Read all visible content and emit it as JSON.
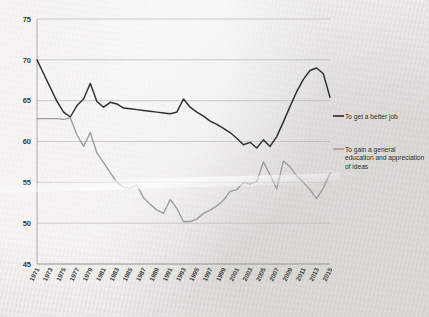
{
  "chart_data": {
    "type": "line",
    "title": "",
    "subtitle": "",
    "xlabel": "",
    "ylabel": "",
    "ylim": [
      45,
      75
    ],
    "yticks": [
      45,
      50,
      55,
      60,
      65,
      70,
      75
    ],
    "grid": true,
    "legend_position": "right",
    "x": [
      1971,
      1972,
      1973,
      1974,
      1975,
      1976,
      1977,
      1978,
      1979,
      1980,
      1981,
      1982,
      1983,
      1984,
      1985,
      1986,
      1987,
      1988,
      1989,
      1990,
      1991,
      1992,
      1993,
      1994,
      1995,
      1996,
      1997,
      1998,
      1999,
      2000,
      2001,
      2002,
      2003,
      2004,
      2005,
      2006,
      2007,
      2008,
      2009,
      2010,
      2011,
      2012,
      2013,
      2014,
      2015
    ],
    "xtick_labels": [
      "1971",
      "1973",
      "1975",
      "1977",
      "1979",
      "1981",
      "1983",
      "1985",
      "1987",
      "1989",
      "1991",
      "1993",
      "1995",
      "1997",
      "1999",
      "2001",
      "2003",
      "2005",
      "2007",
      "2009",
      "2011",
      "2013",
      "2015"
    ],
    "series": [
      {
        "name": "To get a better job",
        "color": "#2e2e2e",
        "values": [
          70.0,
          68.3,
          66.6,
          64.9,
          63.6,
          63.0,
          64.4,
          65.2,
          67.1,
          64.9,
          64.2,
          64.8,
          64.6,
          64.1,
          64.0,
          63.9,
          63.8,
          63.7,
          63.6,
          63.5,
          63.4,
          63.6,
          65.2,
          64.2,
          63.6,
          63.1,
          62.5,
          62.1,
          61.6,
          61.1,
          60.4,
          59.6,
          59.9,
          59.2,
          60.2,
          59.4,
          60.6,
          62.4,
          64.3,
          66.1,
          67.6,
          68.7,
          69.0,
          68.3,
          65.4
        ]
      },
      {
        "name": "To gain a general education and appreciation of ideas",
        "color": "#9b9b9b",
        "values": [
          62.8,
          62.8,
          62.8,
          62.8,
          62.7,
          62.9,
          60.8,
          59.4,
          61.1,
          58.6,
          57.4,
          56.2,
          55.0,
          54.4,
          54.3,
          54.7,
          53.1,
          52.3,
          51.6,
          51.2,
          52.9,
          51.8,
          50.2,
          50.2,
          50.5,
          51.2,
          51.6,
          52.1,
          52.8,
          53.9,
          54.1,
          55.0,
          54.8,
          55.1,
          57.5,
          55.9,
          54.2,
          57.6,
          56.9,
          55.8,
          55.0,
          54.1,
          53.0,
          54.3,
          56.1
        ]
      }
    ]
  },
  "legend": {
    "entries": [
      {
        "label": "To get a better job"
      },
      {
        "label": "To gain a general education and appreciation of ideas"
      }
    ]
  }
}
